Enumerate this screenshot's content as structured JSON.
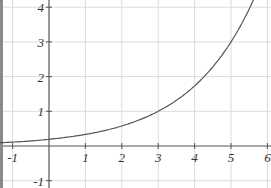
{
  "chart_data": {
    "type": "line",
    "title": "",
    "xlabel": "",
    "ylabel": "",
    "xlim": [
      -1,
      6
    ],
    "ylim": [
      -1,
      4
    ],
    "grid": true,
    "x_ticks": [
      "-1",
      "1",
      "2",
      "3",
      "4",
      "5",
      "6"
    ],
    "y_ticks": [
      "4",
      "3",
      "2",
      "1",
      "-1"
    ],
    "series": [
      {
        "name": "exponential curve",
        "function": "y = 3^((x-3)/2)",
        "x": [
          -1,
          0,
          1,
          2,
          3,
          4,
          5,
          5.6
        ],
        "values": [
          0.11,
          0.19,
          0.33,
          0.58,
          1.0,
          1.73,
          3.0,
          4.15
        ]
      }
    ]
  },
  "colors": {
    "grid": "#dcdcdc",
    "axis": "#555555",
    "curve": "#555555",
    "border": "#8a8a8a"
  }
}
